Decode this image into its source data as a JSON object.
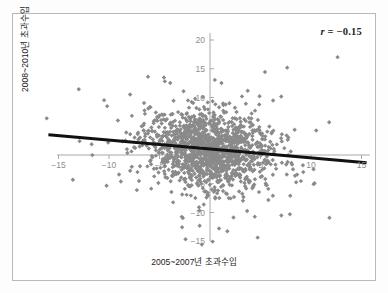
{
  "figure": {
    "background_color": "#ffffff",
    "frame_color": "#b9b9b9"
  },
  "annotation": {
    "r_symbol": "r",
    "r_text": " = −0.15"
  },
  "axis_titles": {
    "y": "2008~2010년 초과수입",
    "x": "2005~2007년 초과수입"
  },
  "chart_data": {
    "type": "scatter",
    "title": "",
    "subtitle": "",
    "xlabel": "2005~2007년 초과수입",
    "ylabel": "2008~2010년 초과수입",
    "xlim": [
      -16.5,
      16.0
    ],
    "ylim": [
      -16.5,
      21.0
    ],
    "xticks": [
      -15,
      -10,
      -5,
      0,
      5,
      10,
      15
    ],
    "xticklabels": [
      "−15",
      "−10",
      "−5",
      "0",
      "5",
      "10",
      "15"
    ],
    "yticks": [
      -15,
      -10,
      -5,
      0,
      5,
      10,
      15,
      20
    ],
    "yticklabels": [
      "−15",
      "−10",
      "−5",
      "0",
      "5",
      "10",
      "15",
      "20"
    ],
    "grid": false,
    "legend": null,
    "annotations": [
      {
        "text": "r = −0.15",
        "position": "top-right",
        "bold": true
      }
    ],
    "marker": {
      "color": "#8a8a8a",
      "shape": "diamond",
      "size": 2.2
    },
    "series": [
      {
        "name": "firms",
        "n_points": 1500,
        "x_mean": 0.0,
        "y_mean": 1.0,
        "x_sd": 3.1,
        "y_sd": 3.3,
        "correlation": -0.15
      }
    ],
    "trendline": {
      "type": "linear",
      "color": "#111111",
      "width": 3,
      "slope": -0.155,
      "intercept": 1.05,
      "x_start": -16.0,
      "x_end": 15.5,
      "y_start": 3.53,
      "y_end": -1.35
    }
  },
  "axes_geometry": {
    "x_zero_px": 210,
    "y_zero_px": 155,
    "px_per_unit_x": 10.1,
    "px_per_unit_y": 5.75,
    "x_axis_left_px": 57,
    "x_axis_right_px": 370,
    "y_axis_top_px": 33,
    "y_axis_bottom_px": 241,
    "axis_color": "#a8a8a8"
  }
}
